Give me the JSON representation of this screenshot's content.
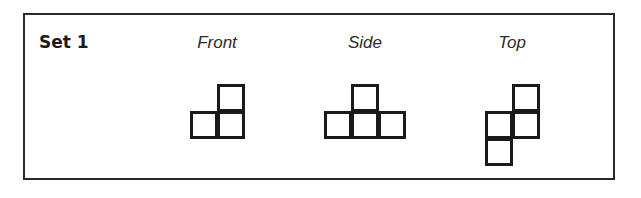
{
  "set": {
    "label": "Set 1"
  },
  "views": [
    {
      "label": "Front",
      "center_x": 217,
      "cells": [
        [
          217,
          84
        ],
        [
          190,
          111
        ],
        [
          217,
          111
        ]
      ]
    },
    {
      "label": "Side",
      "center_x": 365,
      "cells": [
        [
          351,
          84
        ],
        [
          324,
          111
        ],
        [
          351,
          111
        ],
        [
          378,
          111
        ]
      ]
    },
    {
      "label": "Top",
      "center_x": 512,
      "cells": [
        [
          512,
          84
        ],
        [
          485,
          111
        ],
        [
          512,
          111
        ],
        [
          485,
          138
        ]
      ]
    }
  ],
  "colors": {
    "stroke": "#1a1a1a",
    "background": "#ffffff"
  }
}
